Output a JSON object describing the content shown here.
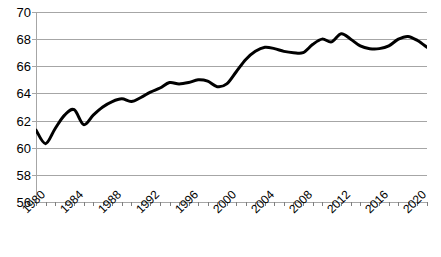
{
  "chart_data": {
    "type": "line",
    "title": "",
    "subtitle": "",
    "xlabel": "",
    "ylabel": "",
    "xlim": [
      1980,
      2021
    ],
    "ylim": [
      56,
      70
    ],
    "ytick_step": 2,
    "ytick_labels": [
      "70",
      "68",
      "66",
      "64",
      "62",
      "60",
      "58",
      "56"
    ],
    "ytick_values": [
      70,
      68,
      66,
      64,
      62,
      60,
      58,
      56
    ],
    "xtick_labels": [
      "1980",
      "1984",
      "1988",
      "1992",
      "1996",
      "2000",
      "2004",
      "2008",
      "2012",
      "2016",
      "2020"
    ],
    "xtick_values": [
      1980,
      1984,
      1988,
      1992,
      1996,
      2000,
      2004,
      2008,
      2012,
      2016,
      2020
    ],
    "xtick_minor_every": 1,
    "grid": "horizontal",
    "legend": "none",
    "line_color": "#000000",
    "line_width": 3,
    "grid_color": "#a6a6a6",
    "background_color": "#ffffff",
    "series": [
      {
        "name": "series-1",
        "x": [
          1980,
          1981,
          1982,
          1983,
          1984,
          1985,
          1986,
          1987,
          1988,
          1989,
          1990,
          1991,
          1992,
          1993,
          1994,
          1995,
          1996,
          1997,
          1998,
          1999,
          2000,
          2001,
          2002,
          2003,
          2004,
          2005,
          2006,
          2007,
          2008,
          2009,
          2010,
          2011,
          2012,
          2013,
          2014,
          2015,
          2016,
          2017,
          2018,
          2019,
          2020,
          2021
        ],
        "values": [
          61.3,
          60.3,
          61.4,
          62.4,
          62.8,
          61.7,
          62.4,
          63.0,
          63.4,
          63.6,
          63.4,
          63.7,
          64.1,
          64.4,
          64.8,
          64.7,
          64.8,
          65.0,
          64.9,
          64.5,
          64.7,
          65.6,
          66.5,
          67.1,
          67.4,
          67.3,
          67.1,
          67.0,
          67.0,
          67.6,
          68.0,
          67.8,
          68.4,
          68.0,
          67.5,
          67.3,
          67.3,
          67.5,
          68.0,
          68.2,
          67.9,
          67.4
        ]
      }
    ]
  }
}
